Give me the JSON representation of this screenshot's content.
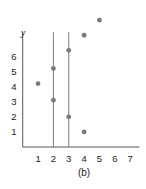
{
  "chart_data": {
    "type": "scatter",
    "title": "",
    "caption": "(b)",
    "xlabel": "",
    "ylabel": "y",
    "x_ticks": [
      "1",
      "2",
      "3",
      "4",
      "5",
      "6",
      "7"
    ],
    "y_ticks": [
      "1",
      "2",
      "3",
      "4",
      "5",
      "6"
    ],
    "xlim": [
      0,
      7.5
    ],
    "ylim": [
      0,
      9
    ],
    "grid": false,
    "points": [
      {
        "x": 1,
        "y": 4.2
      },
      {
        "x": 2,
        "y": 5.2
      },
      {
        "x": 2,
        "y": 3.1
      },
      {
        "x": 3,
        "y": 6.4
      },
      {
        "x": 3,
        "y": 2.0
      },
      {
        "x": 4,
        "y": 7.4
      },
      {
        "x": 4,
        "y": 1.0
      },
      {
        "x": 5,
        "y": 8.4
      }
    ],
    "vertical_lines": [
      {
        "x": 2,
        "y_top": 7.6
      },
      {
        "x": 3,
        "y_top": 7.6
      }
    ],
    "colors": {
      "point": "#7a7a7a",
      "line": "#6e6e6e",
      "axis": "#555555"
    }
  }
}
